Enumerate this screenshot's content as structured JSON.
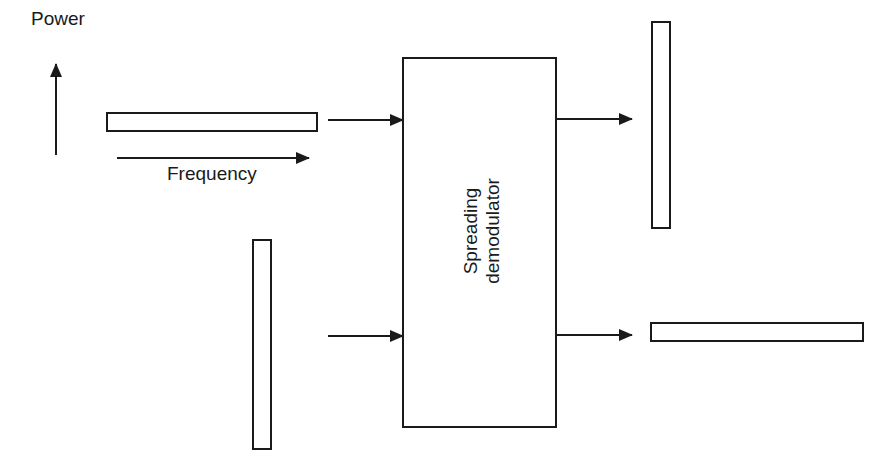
{
  "diagram": {
    "axis_legend": {
      "power_label": "Power",
      "frequency_label": "Frequency"
    },
    "block": {
      "line1": "Spreading",
      "line2": "demodulator"
    },
    "inputs": [
      {
        "name": "wideband-input-signal",
        "shape": "wide-flat"
      },
      {
        "name": "narrowband-input-signal",
        "shape": "narrow-tall"
      }
    ],
    "outputs": [
      {
        "name": "despread-output-signal",
        "shape": "narrow-tall"
      },
      {
        "name": "spread-interference-output",
        "shape": "wide-flat"
      }
    ],
    "colors": {
      "stroke": "#1a1a1a",
      "background": "#ffffff"
    }
  }
}
